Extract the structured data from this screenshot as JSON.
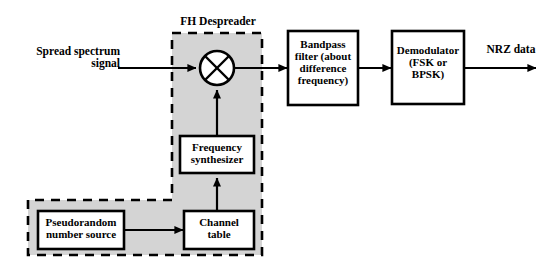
{
  "diagram": {
    "title": "FH Despreader",
    "type": "block-diagram",
    "colors": {
      "stroke": "#000000",
      "fill_region": "#d4d4d4",
      "fill_box": "#ffffff",
      "background": "#ffffff"
    },
    "group_label": "FH Despreader",
    "inputs": [
      {
        "id": "input-signal",
        "label": "Spread spectrum\nsignal"
      }
    ],
    "outputs": [
      {
        "id": "output-data",
        "label": "NRZ data"
      }
    ],
    "blocks": [
      {
        "id": "mixer",
        "label": "",
        "shape": "circle-x",
        "name": "mixer-multiplier"
      },
      {
        "id": "bandpass",
        "label": "Bandpass\nfilter (about\ndifference\nfrequency)",
        "shape": "rect"
      },
      {
        "id": "demodulator",
        "label": "Demodulator\n(FSK or\nBPSK)",
        "shape": "rect"
      },
      {
        "id": "synthesizer",
        "label": "Frequency\nsynthesizer",
        "shape": "rect"
      },
      {
        "id": "channel-table",
        "label": "Channel\ntable",
        "shape": "rect"
      },
      {
        "id": "prn-source",
        "label": "Pseudorandom\nnumber source",
        "shape": "rect"
      }
    ],
    "connections": [
      {
        "from": "input-signal",
        "to": "mixer"
      },
      {
        "from": "mixer",
        "to": "bandpass"
      },
      {
        "from": "bandpass",
        "to": "demodulator"
      },
      {
        "from": "demodulator",
        "to": "output-data"
      },
      {
        "from": "synthesizer",
        "to": "mixer"
      },
      {
        "from": "channel-table",
        "to": "synthesizer"
      },
      {
        "from": "prn-source",
        "to": "channel-table"
      }
    ]
  }
}
